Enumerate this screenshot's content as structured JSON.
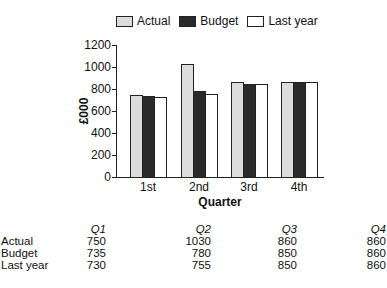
{
  "chart_data": {
    "type": "bar",
    "title": "",
    "xlabel": "Quarter",
    "ylabel": "£000",
    "ylim": [
      0,
      1200
    ],
    "yticks": [
      0,
      200,
      400,
      600,
      800,
      1000,
      1200
    ],
    "categories": [
      "1st",
      "2nd",
      "3rd",
      "4th"
    ],
    "series": [
      {
        "name": "Actual",
        "color": "#dcdcdc",
        "values": [
          750,
          1030,
          860,
          860
        ]
      },
      {
        "name": "Budget",
        "color": "#2a2a2a",
        "values": [
          735,
          780,
          850,
          860
        ]
      },
      {
        "name": "Last year",
        "color": "#ffffff",
        "values": [
          730,
          755,
          850,
          860
        ]
      }
    ],
    "legend_position": "top",
    "grid": false
  },
  "legend": {
    "items": [
      {
        "label": "Actual"
      },
      {
        "label": "Budget"
      },
      {
        "label": "Last year"
      }
    ]
  },
  "axes": {
    "y_title": "£000",
    "x_title": "Quarter",
    "y_ticks": [
      "0",
      "200",
      "400",
      "600",
      "800",
      "1000",
      "1200"
    ],
    "x_ticks": [
      "1st",
      "2nd",
      "3rd",
      "4th"
    ]
  },
  "table": {
    "headers": [
      "Q1",
      "Q2",
      "Q3",
      "Q4"
    ],
    "rows": [
      {
        "label": "Actual",
        "values": [
          "750",
          "1030",
          "860",
          "860"
        ]
      },
      {
        "label": "Budget",
        "values": [
          "735",
          "780",
          "850",
          "860"
        ]
      },
      {
        "label": "Last year",
        "values": [
          "730",
          "755",
          "850",
          "860"
        ]
      }
    ]
  }
}
